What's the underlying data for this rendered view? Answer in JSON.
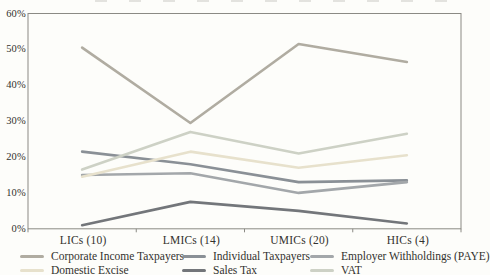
{
  "chart_data": {
    "type": "line",
    "title": "",
    "xlabel": "",
    "ylabel": "",
    "ylim": [
      0,
      60
    ],
    "grid": false,
    "legend_position": "bottom",
    "y_tick_labels": [
      "0%",
      "10%",
      "20%",
      "30%",
      "40%",
      "50%",
      "60%"
    ],
    "categories": [
      "LICs (10)",
      "LMICs (14)",
      "UMICs (20)",
      "HICs (4)"
    ],
    "series": [
      {
        "name": "Corporate Income Taxpayers",
        "color": "#b0aca1",
        "values": [
          50.5,
          29.5,
          51.5,
          46.5
        ]
      },
      {
        "name": "Individual Taxpayers",
        "color": "#8a9096",
        "values": [
          21.5,
          18,
          13,
          13.5
        ]
      },
      {
        "name": "Employer Withholdings (PAYE)",
        "color": "#a3a7aa",
        "values": [
          15,
          15.5,
          10,
          13
        ]
      },
      {
        "name": "Domestic Excise",
        "color": "#e7e1cc",
        "values": [
          14.5,
          21.5,
          17,
          20.5
        ]
      },
      {
        "name": "Sales Tax",
        "color": "#73767a",
        "values": [
          1,
          7.5,
          5,
          1.5
        ]
      },
      {
        "name": "VAT",
        "color": "#cdd1c5",
        "values": [
          16.5,
          27,
          21,
          26.5
        ]
      }
    ]
  },
  "axis": {
    "box_color": "#8b8a84",
    "tick_color": "#8b8a84"
  }
}
